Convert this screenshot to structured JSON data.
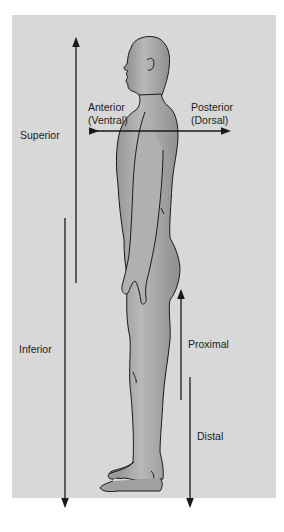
{
  "diagram": {
    "title": "",
    "colors": {
      "background": "#d8d8d8",
      "figure_fill": "#a6a6a6",
      "figure_outline": "#1a1a1a",
      "arrow": "#1a1a1a",
      "text": "#222222"
    },
    "labels": {
      "anterior": "Anterior",
      "ventral": "(Ventral)",
      "posterior": "Posterior",
      "dorsal": "(Dorsal)",
      "superior": "Superior",
      "inferior": "Inferior",
      "proximal": "Proximal",
      "distal": "Distal"
    },
    "arrows": [
      {
        "name": "superior",
        "direction": "up"
      },
      {
        "name": "inferior",
        "direction": "down"
      },
      {
        "name": "anterior-posterior",
        "direction": "left-right"
      },
      {
        "name": "proximal",
        "direction": "up"
      },
      {
        "name": "distal",
        "direction": "down"
      }
    ]
  }
}
